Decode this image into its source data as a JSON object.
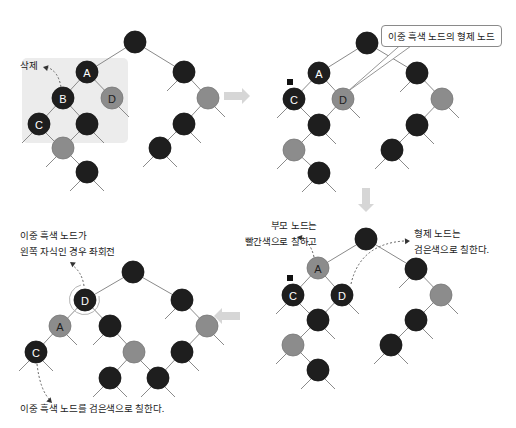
{
  "colors": {
    "black_node": "#1e1e1e",
    "gray_node": "#8c8c8c",
    "edge": "#8a8a8a",
    "highlight_box": "#ececec",
    "arrow": "#d6d6d6",
    "label_on_black": "#ffffff",
    "label_on_gray": "#1e1e1e"
  },
  "node_radius": 11,
  "panels": [
    {
      "id": "step1",
      "highlight_box": {
        "x": 22,
        "y": 58,
        "w": 106,
        "h": 85
      },
      "nodes": [
        {
          "id": "r",
          "x": 135,
          "y": 42,
          "color": "black",
          "label": ""
        },
        {
          "id": "A",
          "x": 87,
          "y": 72,
          "color": "black",
          "label": "A"
        },
        {
          "id": "B",
          "x": 63,
          "y": 98,
          "color": "black",
          "label": "B"
        },
        {
          "id": "D",
          "x": 112,
          "y": 98,
          "color": "gray",
          "label": "D"
        },
        {
          "id": "C",
          "x": 39,
          "y": 124,
          "color": "black",
          "label": "C"
        },
        {
          "id": "n1",
          "x": 87,
          "y": 124,
          "color": "black",
          "label": ""
        },
        {
          "id": "n2",
          "x": 63,
          "y": 148,
          "color": "gray",
          "label": ""
        },
        {
          "id": "n3",
          "x": 87,
          "y": 172,
          "color": "black",
          "label": ""
        },
        {
          "id": "R1",
          "x": 184,
          "y": 72,
          "color": "black",
          "label": ""
        },
        {
          "id": "R2",
          "x": 208,
          "y": 98,
          "color": "gray",
          "label": ""
        },
        {
          "id": "R3",
          "x": 184,
          "y": 124,
          "color": "black",
          "label": ""
        },
        {
          "id": "R4",
          "x": 160,
          "y": 148,
          "color": "black",
          "label": ""
        }
      ],
      "edges": [
        [
          "r",
          "A"
        ],
        [
          "A",
          "B"
        ],
        [
          "A",
          "D"
        ],
        [
          "B",
          "C"
        ],
        [
          "B",
          "n1"
        ],
        [
          "n1",
          "n2"
        ],
        [
          "n2",
          "n3"
        ],
        [
          "r",
          "R1"
        ],
        [
          "R1",
          "R2"
        ],
        [
          "R2",
          "R3"
        ],
        [
          "R3",
          "R4"
        ]
      ],
      "leaf_stubs": [
        [
          "C",
          "L"
        ],
        [
          "C",
          "R"
        ],
        [
          "D",
          "R"
        ],
        [
          "n1",
          "R"
        ],
        [
          "n2",
          "L"
        ],
        [
          "n3",
          "L"
        ],
        [
          "n3",
          "R"
        ],
        [
          "R1",
          "L"
        ],
        [
          "R2",
          "R"
        ],
        [
          "R3",
          "R"
        ],
        [
          "R4",
          "L"
        ],
        [
          "R4",
          "R"
        ]
      ],
      "markers": []
    },
    {
      "id": "step2",
      "nodes": [
        {
          "id": "r",
          "x": 367,
          "y": 43,
          "color": "black",
          "label": ""
        },
        {
          "id": "A",
          "x": 319,
          "y": 73,
          "color": "black",
          "label": "A"
        },
        {
          "id": "C",
          "x": 294,
          "y": 99,
          "color": "black",
          "label": "C"
        },
        {
          "id": "D",
          "x": 343,
          "y": 99,
          "color": "gray",
          "label": "D"
        },
        {
          "id": "n1",
          "x": 319,
          "y": 125,
          "color": "black",
          "label": ""
        },
        {
          "id": "n2",
          "x": 294,
          "y": 150,
          "color": "gray",
          "label": ""
        },
        {
          "id": "n3",
          "x": 319,
          "y": 173,
          "color": "black",
          "label": ""
        },
        {
          "id": "R1",
          "x": 417,
          "y": 73,
          "color": "black",
          "label": ""
        },
        {
          "id": "R2",
          "x": 442,
          "y": 99,
          "color": "gray",
          "label": ""
        },
        {
          "id": "R3",
          "x": 417,
          "y": 125,
          "color": "black",
          "label": ""
        },
        {
          "id": "R4",
          "x": 392,
          "y": 150,
          "color": "black",
          "label": ""
        }
      ],
      "edges": [
        [
          "r",
          "A"
        ],
        [
          "A",
          "C"
        ],
        [
          "A",
          "D"
        ],
        [
          "D",
          "n1"
        ],
        [
          "n1",
          "n2"
        ],
        [
          "n2",
          "n3"
        ],
        [
          "r",
          "R1"
        ],
        [
          "R1",
          "R2"
        ],
        [
          "R2",
          "R3"
        ],
        [
          "R3",
          "R4"
        ]
      ],
      "leaf_stubs": [
        [
          "C",
          "L"
        ],
        [
          "C",
          "R"
        ],
        [
          "D",
          "R"
        ],
        [
          "n1",
          "R"
        ],
        [
          "n2",
          "L"
        ],
        [
          "n3",
          "L"
        ],
        [
          "n3",
          "R"
        ],
        [
          "R1",
          "L"
        ],
        [
          "R2",
          "R"
        ],
        [
          "R3",
          "R"
        ],
        [
          "R4",
          "L"
        ],
        [
          "R4",
          "R"
        ]
      ],
      "markers": [
        {
          "x": 290,
          "y": 82
        }
      ]
    },
    {
      "id": "step3",
      "nodes": [
        {
          "id": "r",
          "x": 366,
          "y": 239,
          "color": "black",
          "label": ""
        },
        {
          "id": "A",
          "x": 318,
          "y": 268,
          "color": "gray",
          "label": "A"
        },
        {
          "id": "C",
          "x": 293,
          "y": 295,
          "color": "black",
          "label": "C"
        },
        {
          "id": "D",
          "x": 342,
          "y": 295,
          "color": "black",
          "label": "D"
        },
        {
          "id": "n1",
          "x": 318,
          "y": 320,
          "color": "black",
          "label": ""
        },
        {
          "id": "n2",
          "x": 293,
          "y": 345,
          "color": "gray",
          "label": ""
        },
        {
          "id": "n3",
          "x": 318,
          "y": 370,
          "color": "black",
          "label": ""
        },
        {
          "id": "R1",
          "x": 416,
          "y": 269,
          "color": "black",
          "label": ""
        },
        {
          "id": "R2",
          "x": 441,
          "y": 295,
          "color": "gray",
          "label": ""
        },
        {
          "id": "R3",
          "x": 416,
          "y": 320,
          "color": "black",
          "label": ""
        },
        {
          "id": "R4",
          "x": 391,
          "y": 345,
          "color": "black",
          "label": ""
        }
      ],
      "edges": [
        [
          "r",
          "A"
        ],
        [
          "A",
          "C"
        ],
        [
          "A",
          "D"
        ],
        [
          "D",
          "n1"
        ],
        [
          "n1",
          "n2"
        ],
        [
          "n2",
          "n3"
        ],
        [
          "r",
          "R1"
        ],
        [
          "R1",
          "R2"
        ],
        [
          "R2",
          "R3"
        ],
        [
          "R3",
          "R4"
        ]
      ],
      "leaf_stubs": [
        [
          "C",
          "L"
        ],
        [
          "C",
          "R"
        ],
        [
          "D",
          "R"
        ],
        [
          "n1",
          "R"
        ],
        [
          "n2",
          "L"
        ],
        [
          "n3",
          "L"
        ],
        [
          "n3",
          "R"
        ],
        [
          "R1",
          "L"
        ],
        [
          "R2",
          "R"
        ],
        [
          "R3",
          "R"
        ],
        [
          "R4",
          "L"
        ],
        [
          "R4",
          "R"
        ]
      ],
      "markers": [
        {
          "x": 290,
          "y": 278
        }
      ]
    },
    {
      "id": "step4",
      "nodes": [
        {
          "id": "r",
          "x": 133,
          "y": 272,
          "color": "black",
          "label": ""
        },
        {
          "id": "D",
          "x": 85,
          "y": 300,
          "color": "black",
          "label": "D"
        },
        {
          "id": "A",
          "x": 60,
          "y": 326,
          "color": "gray",
          "label": "A"
        },
        {
          "id": "C",
          "x": 36,
          "y": 352,
          "color": "black",
          "label": "C"
        },
        {
          "id": "n1",
          "x": 110,
          "y": 326,
          "color": "black",
          "label": ""
        },
        {
          "id": "n2",
          "x": 134,
          "y": 352,
          "color": "gray",
          "label": ""
        },
        {
          "id": "n3",
          "x": 110,
          "y": 378,
          "color": "black",
          "label": ""
        },
        {
          "id": "R1",
          "x": 182,
          "y": 300,
          "color": "black",
          "label": ""
        },
        {
          "id": "R2",
          "x": 207,
          "y": 326,
          "color": "gray",
          "label": ""
        },
        {
          "id": "R3",
          "x": 182,
          "y": 352,
          "color": "black",
          "label": ""
        },
        {
          "id": "R4",
          "x": 158,
          "y": 378,
          "color": "black",
          "label": ""
        }
      ],
      "edges": [
        [
          "r",
          "D"
        ],
        [
          "D",
          "A"
        ],
        [
          "D",
          "n1"
        ],
        [
          "A",
          "C"
        ],
        [
          "n1",
          "n2"
        ],
        [
          "n2",
          "n3"
        ],
        [
          "r",
          "R1"
        ],
        [
          "R1",
          "R2"
        ],
        [
          "R2",
          "R3"
        ],
        [
          "R3",
          "R4"
        ]
      ],
      "leaf_stubs": [
        [
          "C",
          "L"
        ],
        [
          "C",
          "R"
        ],
        [
          "A",
          "R"
        ],
        [
          "n1",
          "L"
        ],
        [
          "n2",
          "R"
        ],
        [
          "n3",
          "L"
        ],
        [
          "n3",
          "R"
        ],
        [
          "R1",
          "L"
        ],
        [
          "R2",
          "R"
        ],
        [
          "R3",
          "R"
        ],
        [
          "R4",
          "L"
        ],
        [
          "R4",
          "R"
        ]
      ],
      "markers": [],
      "rotation_ring": {
        "node": "D",
        "r": 15
      }
    }
  ],
  "arrows": [
    {
      "id": "step1-to-step2",
      "dir": "right",
      "x": 236,
      "y": 96
    },
    {
      "id": "step2-to-step3",
      "dir": "down",
      "x": 366,
      "y": 198
    },
    {
      "id": "step3-to-step4",
      "dir": "left",
      "x": 228,
      "y": 316
    }
  ],
  "dashed_arrows": [
    {
      "id": "delete-arrow",
      "path": "M 61 87 Q 58 70 46 67",
      "head": [
        43,
        67
      ]
    },
    {
      "id": "parent-red-arrow",
      "path": "M 314 257 Q 310 240 299 238",
      "head": [
        297,
        237
      ]
    },
    {
      "id": "sibling-black-arrow",
      "path": "M 351 284 Q 360 244 404 241",
      "head": [
        410,
        241
      ]
    },
    {
      "id": "rotate-arrow",
      "path": "M 84 286 Q 82 272 72 265",
      "head": [
        70,
        262
      ]
    },
    {
      "id": "recolor-arrow",
      "path": "M 37 364 Q 40 390 50 400",
      "head": [
        52,
        403
      ]
    }
  ],
  "callout_pointer": {
    "from_x1": 405,
    "from_x2": 418,
    "from_y": 41,
    "to_x": 347,
    "to_y": 92
  },
  "labels": {
    "delete": "삭제",
    "sibling_of_double_black": "이중 흑색 노드의 형제 노드",
    "parent_red_line1": "부모 노드는",
    "parent_red_line2": "빨간색으로 칠하고",
    "sibling_black_line1": "형제 노드는",
    "sibling_black_line2": "검은색으로 칠한다.",
    "rotate_line1": "이중 흑색 노드가",
    "rotate_line2": "왼쪽 자식인 경우 좌회전",
    "recolor_double_black": "이중 흑색 노드를 검은색으로 칠한다."
  }
}
